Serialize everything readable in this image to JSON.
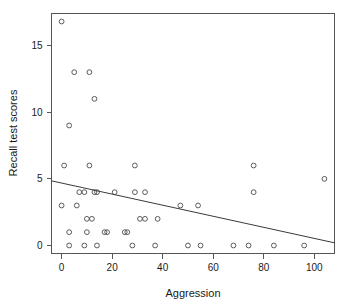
{
  "chart_data": {
    "type": "scatter",
    "title": "",
    "xlabel": "Aggression",
    "ylabel": "Recall test scores",
    "xlim": [
      -4,
      108
    ],
    "ylim": [
      -0.6,
      17.4
    ],
    "xticks": [
      0,
      20,
      40,
      60,
      80,
      100
    ],
    "yticks": [
      0,
      5,
      10,
      15
    ],
    "xtick_labels": [
      "0",
      "20",
      "40",
      "60",
      "80",
      "100"
    ],
    "ytick_labels": [
      "0",
      "5",
      "10",
      "15"
    ],
    "grid": false,
    "legend": null,
    "marker": "open-circle",
    "marker_color": "#4a4a4a",
    "points": [
      [
        0,
        16.8
      ],
      [
        5,
        13
      ],
      [
        11,
        13
      ],
      [
        13,
        11
      ],
      [
        3,
        9
      ],
      [
        1,
        6
      ],
      [
        11,
        6
      ],
      [
        29,
        6
      ],
      [
        76,
        6
      ],
      [
        104,
        5
      ],
      [
        7,
        4
      ],
      [
        9,
        4
      ],
      [
        13,
        4
      ],
      [
        14,
        4
      ],
      [
        21,
        4
      ],
      [
        29,
        4
      ],
      [
        33,
        4
      ],
      [
        76,
        4
      ],
      [
        0,
        3
      ],
      [
        6,
        3
      ],
      [
        47,
        3
      ],
      [
        54,
        3
      ],
      [
        10,
        2
      ],
      [
        12,
        2
      ],
      [
        31,
        2
      ],
      [
        33,
        2
      ],
      [
        38,
        2
      ],
      [
        3,
        1
      ],
      [
        10,
        1
      ],
      [
        17,
        1
      ],
      [
        18,
        1
      ],
      [
        25,
        1
      ],
      [
        26,
        1
      ],
      [
        3,
        0
      ],
      [
        9,
        0
      ],
      [
        14,
        0
      ],
      [
        28,
        0
      ],
      [
        37,
        0
      ],
      [
        50,
        0
      ],
      [
        55,
        0
      ],
      [
        68,
        0
      ],
      [
        74,
        0
      ],
      [
        84,
        0
      ],
      [
        96,
        0
      ]
    ],
    "regression_line": {
      "x_start": -4,
      "y_start": 4.85,
      "x_end": 108,
      "y_end": 0.2,
      "color": "#3a3a3a"
    }
  },
  "axes": {
    "x_axis_label": "Aggression",
    "y_axis_label": "Recall test scores"
  }
}
